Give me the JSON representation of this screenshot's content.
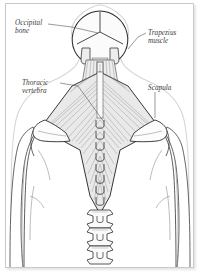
{
  "figure": {
    "view": "posterior",
    "frame": {
      "border_color": "#c9c9c9",
      "background_color": "#ffffff"
    },
    "colors": {
      "outline": "#2b2b2b",
      "body_contour": "#4a4a4a",
      "muscle_fiber": "#8b8b8b",
      "muscle_fill": "#e8e8e8",
      "bone_fill": "#f2f2f2",
      "label_text": "#3a3a3a",
      "leader_line": "#555555",
      "skin_halo": "#d8d8d8"
    },
    "labels": [
      {
        "id": "occipital-bone",
        "text": "Occipital\nbone",
        "structure": "occipital bone",
        "side": "left"
      },
      {
        "id": "trapezius-muscle",
        "text": "Trapezius\nmuscle",
        "structure": "trapezius muscle",
        "side": "right"
      },
      {
        "id": "thoracic-vertebra",
        "text": "Thoracic\nvertebra",
        "structure": "thoracic vertebra",
        "side": "left"
      },
      {
        "id": "scapula",
        "text": "Scapula",
        "structure": "scapula",
        "side": "right"
      }
    ],
    "structures": [
      "skull",
      "occipital bone",
      "cervical spine",
      "trapezius muscle",
      "scapula",
      "thoracic vertebrae",
      "lumbar vertebrae",
      "shoulders",
      "arms",
      "torso"
    ]
  }
}
